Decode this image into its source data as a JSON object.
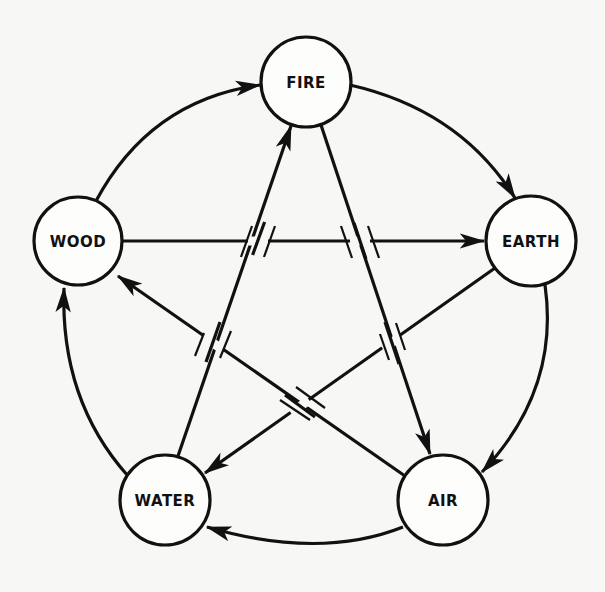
{
  "diagram": {
    "type": "directed-cycle-pentagram",
    "background": "#f7f7f5",
    "ink": "#111111",
    "nodes": [
      {
        "id": "fire",
        "label": "FIRE",
        "cx": 306,
        "cy": 82,
        "r": 45
      },
      {
        "id": "earth",
        "label": "EARTH",
        "cx": 531,
        "cy": 241,
        "r": 45
      },
      {
        "id": "air",
        "label": "AIR",
        "cx": 443,
        "cy": 500,
        "r": 45
      },
      {
        "id": "water",
        "label": "WATER",
        "cx": 165,
        "cy": 500,
        "r": 45
      },
      {
        "id": "wood",
        "label": "WOOD",
        "cx": 78,
        "cy": 241,
        "r": 44
      }
    ],
    "outer_cycle": [
      {
        "from": "WOOD",
        "to": "FIRE"
      },
      {
        "from": "FIRE",
        "to": "EARTH"
      },
      {
        "from": "EARTH",
        "to": "AIR"
      },
      {
        "from": "AIR",
        "to": "WATER"
      },
      {
        "from": "WATER",
        "to": "WOOD"
      }
    ],
    "inner_star": [
      {
        "from": "WOOD",
        "to": "EARTH"
      },
      {
        "from": "FIRE",
        "to": "AIR"
      },
      {
        "from": "EARTH",
        "to": "WATER"
      },
      {
        "from": "WATER",
        "to": "FIRE"
      },
      {
        "from": "AIR",
        "to": "WOOD"
      }
    ],
    "crossings_marked": 5
  }
}
